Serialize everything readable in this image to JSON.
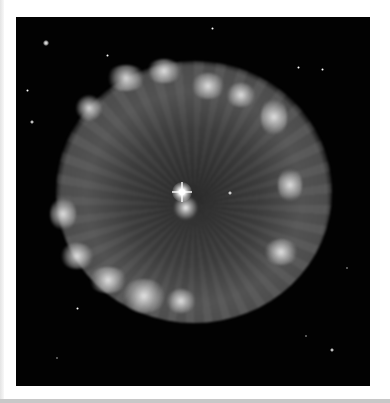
{
  "image": {
    "subject": "planetary nebula",
    "description": "Grayscale astronomical photograph of a roughly circular planetary nebula with radial filaments, a bright knotty rim, and a bright central star against a black star field",
    "colors": {
      "background": "#020202",
      "frame": "#ffffff",
      "nebula_gray": "#9a9a9a",
      "rim_highlight": "#f0f0f0"
    }
  }
}
